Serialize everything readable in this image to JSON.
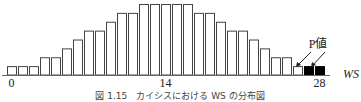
{
  "chart_data": {
    "type": "bar",
    "title": "",
    "xlabel": "WS",
    "ylabel": "",
    "x": [
      0,
      1,
      2,
      3,
      4,
      5,
      6,
      7,
      8,
      9,
      10,
      11,
      12,
      13,
      14,
      15,
      16,
      17,
      18,
      19,
      20,
      21,
      22,
      23,
      24,
      25,
      26,
      27,
      28
    ],
    "values": [
      1,
      1,
      1,
      2,
      2,
      3,
      4,
      5,
      5,
      6,
      7,
      7,
      8,
      8,
      8,
      8,
      8,
      7,
      7,
      6,
      5,
      5,
      4,
      3,
      2,
      2,
      1,
      1,
      1
    ],
    "highlighted": [
      27,
      28
    ],
    "highlight_color": "#000000",
    "bar_color": "#ffffff",
    "bar_edge_color": "#444444",
    "tick_labels": [
      "0",
      "14",
      "28"
    ],
    "tick_positions": [
      0,
      14,
      28
    ],
    "ylim": [
      0,
      8
    ],
    "grid": false,
    "annotation": "P値",
    "caption": "図 1.15　カイシスにおける WS の分布図"
  }
}
